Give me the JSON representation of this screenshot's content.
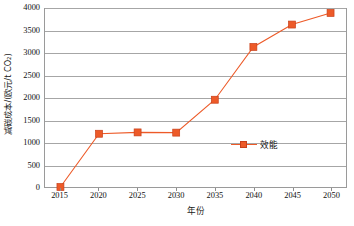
{
  "chart_data": {
    "type": "line",
    "title": "",
    "xlabel": "年份",
    "ylabel": "减碳成本/(欧元/t CO₂)",
    "x": [
      2015,
      2020,
      2025,
      2030,
      2035,
      2040,
      2045,
      2050
    ],
    "xtick_labels": [
      "2015",
      "2020",
      "2025",
      "2030",
      "2035",
      "2040",
      "2045",
      "2050"
    ],
    "xlim": [
      2013,
      2052
    ],
    "ylim": [
      0,
      4000
    ],
    "ytick_labels": [
      "0",
      "500",
      "1000",
      "1500",
      "2000",
      "2500",
      "3000",
      "3500",
      "4000"
    ],
    "yticks": [
      0,
      500,
      1000,
      1500,
      2000,
      2500,
      3000,
      3500,
      4000
    ],
    "grid": "horizontal",
    "legend_position": "inside-right",
    "series": [
      {
        "name": "效能",
        "color": "#ED5A28",
        "marker": "square",
        "values": [
          0,
          1190,
          1220,
          1215,
          1950,
          3130,
          3630,
          3890
        ]
      }
    ]
  },
  "legend": {
    "label": "效能"
  },
  "axis": {
    "x_title": "年份",
    "y_title": "减碳成本/(欧元/t CO₂)"
  }
}
